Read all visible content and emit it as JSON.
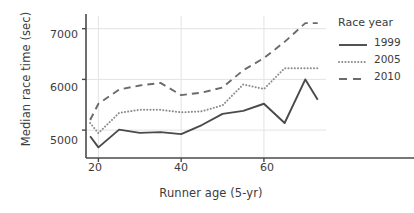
{
  "chart_data": {
    "type": "line",
    "title": "",
    "xlabel": "Runner age (5-yr)",
    "ylabel": "Median race time (sec)",
    "xlim": [
      17,
      75
    ],
    "ylim": [
      4450,
      7250
    ],
    "xticks": [
      20,
      40,
      60
    ],
    "yticks": [
      5000,
      6000,
      7000
    ],
    "xtick_labels": [
      "20",
      "40",
      "60"
    ],
    "ytick_labels": [
      "5000",
      "6000",
      "7000"
    ],
    "grid": true,
    "grid_axis": "y",
    "legend_position": "right",
    "legend_title": "Race year",
    "x": [
      18,
      20,
      25,
      30,
      35,
      40,
      45,
      50,
      55,
      60,
      65,
      70,
      73
    ],
    "series": [
      {
        "name": "1999",
        "style": "solid",
        "color": "#4a4a4a",
        "values": [
          4880,
          4660,
          5010,
          4945,
          4960,
          4920,
          5100,
          5320,
          5380,
          5520,
          5140,
          6000,
          5600
        ]
      },
      {
        "name": "2005",
        "style": "dotted",
        "color": "#8c8c8c",
        "values": [
          5140,
          4940,
          5340,
          5400,
          5400,
          5350,
          5370,
          5490,
          5900,
          5810,
          6220,
          6220,
          6220
        ]
      },
      {
        "name": "2010",
        "style": "dashed",
        "color": "#6b6b6b",
        "values": [
          5200,
          5520,
          5800,
          5880,
          5930,
          5690,
          5740,
          5840,
          6180,
          6420,
          6740,
          7110,
          7110
        ]
      }
    ]
  }
}
